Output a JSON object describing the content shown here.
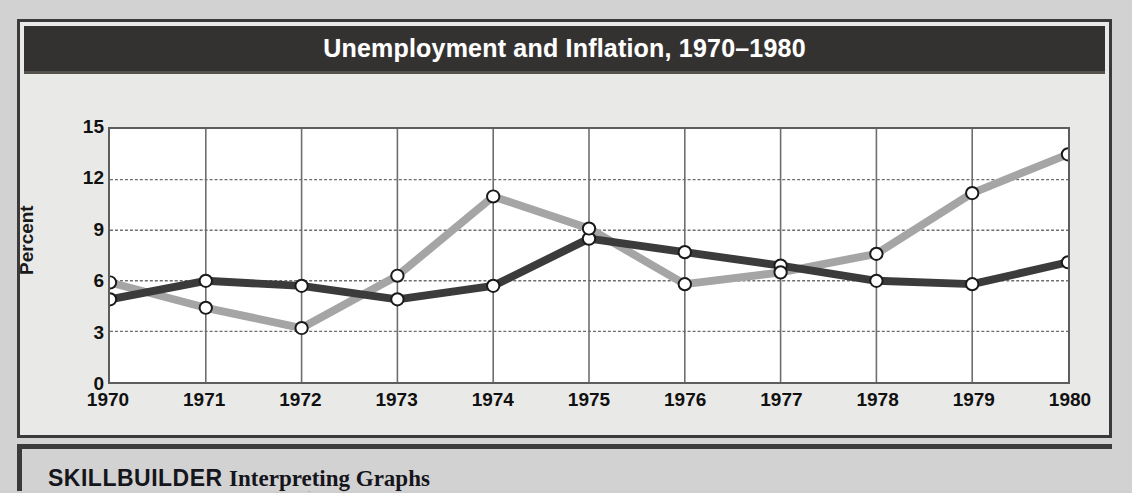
{
  "figure": {
    "title": "Unemployment and Inflation, 1970–1980",
    "source_prefix": "Source:",
    "source_italic": "Statistical Abstract of the United States, 1980, 1995"
  },
  "footer": {
    "skillbuilder": "SKILLBUILDER",
    "subtitle": "Interpreting Graphs"
  },
  "colors": {
    "unemployment": "#3b3b3b",
    "inflation": "#a5a5a5",
    "title_band": "#333230",
    "frame": "#3a3a3a",
    "panel": "#e9e9e7",
    "plot_bg": "#ffffff",
    "grid": "#6e6e6e"
  },
  "chart_data": {
    "type": "line",
    "title": "Unemployment and Inflation, 1970–1980",
    "xlabel": "",
    "ylabel": "Percent",
    "ylim": [
      0,
      15
    ],
    "yticks": [
      15,
      12,
      9,
      6,
      3,
      0
    ],
    "xlim": [
      1970,
      1980
    ],
    "categories": [
      "1970",
      "1971",
      "1972",
      "1973",
      "1974",
      "1975",
      "1976",
      "1977",
      "1978",
      "1979",
      "1980"
    ],
    "grid": true,
    "legend_position": "bottom-right",
    "markers": "open-circle",
    "series": [
      {
        "name": "Unemployment Rate",
        "color": "#3b3b3b",
        "values": [
          4.9,
          6.0,
          5.7,
          4.9,
          5.7,
          8.5,
          7.7,
          6.9,
          6.0,
          5.8,
          7.1
        ]
      },
      {
        "name": "Inflation Rate",
        "color": "#a5a5a5",
        "values": [
          5.9,
          4.4,
          3.2,
          6.3,
          11.0,
          9.1,
          5.8,
          6.5,
          7.6,
          11.2,
          13.5
        ]
      }
    ]
  }
}
